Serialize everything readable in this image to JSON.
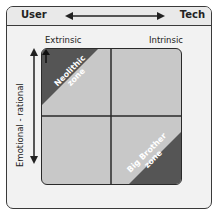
{
  "header": {
    "left_label": "User",
    "right_label": "Tech",
    "arrow": "double-headed-horizontal-arrow"
  },
  "columns": {
    "left": "Extrinsic",
    "right": "Intrinsic"
  },
  "vertical_axis": {
    "label": "Emotional - rational",
    "arrow": "double-headed-vertical-arrow"
  },
  "zones": {
    "top_left": {
      "line1": "Neolithic",
      "line2": "zone"
    },
    "bottom_right": {
      "line1": "Big Brother",
      "line2": "zone"
    }
  },
  "colors": {
    "frame_bg": "#f2f2f2",
    "grid_bg": "#c8c8c8",
    "zone_fill": "#555555",
    "line": "#2a2a2a"
  }
}
